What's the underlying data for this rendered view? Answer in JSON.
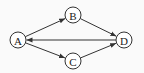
{
  "diagram": {
    "type": "directed-graph",
    "colors": {
      "stroke": "#333333",
      "node_fill": "#ffffff",
      "background": "#fafafa"
    },
    "nodes": [
      {
        "id": "A",
        "label": "A",
        "x": 18,
        "y": 40
      },
      {
        "id": "B",
        "label": "B",
        "x": 73,
        "y": 15
      },
      {
        "id": "C",
        "label": "C",
        "x": 73,
        "y": 61
      },
      {
        "id": "D",
        "label": "D",
        "x": 124,
        "y": 40
      }
    ],
    "edges": [
      {
        "from": "A",
        "to": "B"
      },
      {
        "from": "B",
        "to": "D"
      },
      {
        "from": "D",
        "to": "A"
      },
      {
        "from": "A",
        "to": "C"
      },
      {
        "from": "C",
        "to": "D"
      }
    ]
  }
}
